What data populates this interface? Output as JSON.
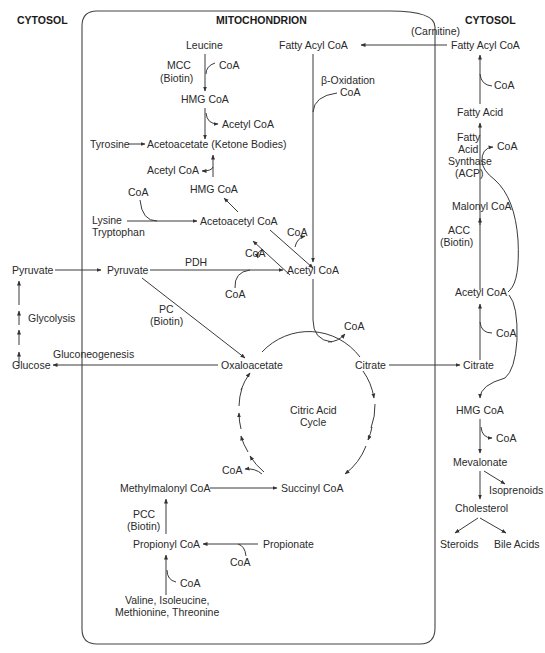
{
  "headers": {
    "cytosol_left": "CYTOSOL",
    "mitochondrion": "MITOCHONDRION",
    "cytosol_right": "CYTOSOL"
  },
  "mito": {
    "leucine": "Leucine",
    "mcc": "MCC",
    "mcc_biotin": "(Biotin)",
    "coa_leu": "CoA",
    "hmg_coa_top": "HMG CoA",
    "acetyl_coa_out1": "Acetyl CoA",
    "tyrosine": "Tyrosine",
    "acetoacetate": "Acetoacetate (Ketone Bodies)",
    "acetyl_coa_in2": "Acetyl CoA",
    "hmg_coa_mid": "HMG CoA",
    "coa_lys": "CoA",
    "lysine": "Lysine",
    "tryptophan": "Tryptophan",
    "acetoacetyl_coa": "Acetoacetyl CoA",
    "coa_aa1": "CoA",
    "coa_aa2": "CoA",
    "fatty_acyl_coa": "Fatty Acyl CoA",
    "beta_ox": "β-Oxidation",
    "beta_coa": "CoA",
    "pyruvate": "Pyruvate",
    "pdh": "PDH",
    "coa_pdh": "CoA",
    "acetyl_coa": "Acetyl CoA",
    "pc": "PC",
    "pc_biotin": "(Biotin)",
    "coa_cit": "CoA",
    "oxaloacetate": "Oxaloacetate",
    "citrate": "Citrate",
    "cycle_l1": "Citric Acid",
    "cycle_l2": "Cycle",
    "coa_succ": "CoA",
    "methylmalonyl": "Methylmalonyl CoA",
    "succinyl": "Succinyl CoA",
    "pcc": "PCC",
    "pcc_biotin": "(Biotin)",
    "propionyl": "Propionyl CoA",
    "propionate": "Propionate",
    "coa_prop": "CoA",
    "coa_val": "CoA",
    "val_l1": "Valine, Isoleucine,",
    "val_l2": "Methionine, Threonine"
  },
  "cyto_left": {
    "pyruvate": "Pyruvate",
    "glycolysis": "Glycolysis",
    "gluconeogenesis": "Gluconeogenesis",
    "glucose": "Glucose"
  },
  "cyto_right": {
    "carnitine": "(Carnitine)",
    "fatty_acyl_coa": "Fatty Acyl CoA",
    "coa1": "CoA",
    "fatty_acid": "Fatty Acid",
    "fas_l1": "Fatty",
    "fas_l2": "Acid",
    "fas_l3": "Synthase",
    "fas_l4": "(ACP)",
    "coa2": "CoA",
    "malonyl": "Malonyl CoA",
    "acc": "ACC",
    "acc_biotin": "(Biotin)",
    "acetyl_coa": "Acetyl CoA",
    "coa3": "CoA",
    "citrate": "Citrate",
    "hmg_coa": "HMG CoA",
    "coa4": "CoA",
    "mevalonate": "Mevalonate",
    "isoprenoids": "Isoprenoids",
    "cholesterol": "Cholesterol",
    "steroids": "Steroids",
    "bile_acids": "Bile Acids"
  }
}
